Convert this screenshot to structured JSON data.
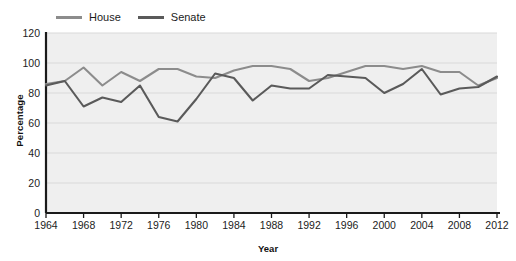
{
  "chart_data": {
    "type": "line",
    "title": "",
    "xlabel": "Year",
    "ylabel": "Percentage",
    "xlim": [
      1964,
      2012
    ],
    "ylim": [
      0,
      120
    ],
    "ytick_step": 20,
    "grid": true,
    "legend_position": "top-left",
    "xticks": [
      1964,
      1968,
      1972,
      1976,
      1980,
      1984,
      1988,
      1992,
      1996,
      2000,
      2004,
      2008,
      2012
    ],
    "yticks": [
      0,
      20,
      40,
      60,
      80,
      100,
      120
    ],
    "x": [
      1964,
      1966,
      1968,
      1970,
      1972,
      1974,
      1976,
      1978,
      1980,
      1982,
      1984,
      1986,
      1988,
      1990,
      1992,
      1994,
      1996,
      1998,
      2000,
      2002,
      2004,
      2006,
      2008,
      2010,
      2012
    ],
    "series": [
      {
        "name": "House",
        "color": "#8c8c8c",
        "values": [
          86,
          88,
          97,
          85,
          94,
          88,
          96,
          96,
          91,
          90,
          95,
          98,
          98,
          96,
          88,
          90,
          94,
          98,
          98,
          96,
          98,
          94,
          94,
          85,
          90
        ]
      },
      {
        "name": "Senate",
        "color": "#5a5a5a",
        "values": [
          85,
          88,
          71,
          77,
          74,
          85,
          64,
          61,
          76,
          93,
          90,
          75,
          85,
          83,
          83,
          92,
          91,
          90,
          80,
          86,
          96,
          79,
          83,
          84,
          91
        ]
      }
    ]
  },
  "legend": {
    "items": [
      {
        "label": "House"
      },
      {
        "label": "Senate"
      }
    ]
  },
  "colors": {
    "house": "#8c8c8c",
    "senate": "#5a5a5a",
    "plot_background": "#efefef",
    "gridline": "#d9d9d9",
    "axis": "#1a1a1a",
    "text": "#1c1c1c"
  }
}
